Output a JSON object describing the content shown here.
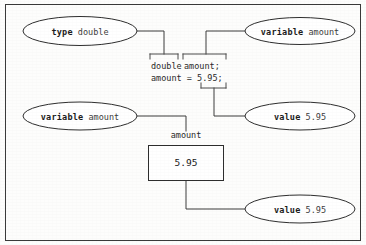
{
  "figure": {
    "frame_color": "#3a3a3a",
    "background_color": "#fdfdfc",
    "line_color": "#3c3c3c"
  },
  "callouts": [
    {
      "id": "type-double",
      "keyword": "type",
      "value": "double"
    },
    {
      "id": "variable-amount-top",
      "keyword": "variable",
      "value": "amount"
    },
    {
      "id": "variable-amount-bottom",
      "keyword": "variable",
      "value": "amount"
    },
    {
      "id": "value-595-middle",
      "keyword": "value",
      "value": "5.95"
    },
    {
      "id": "value-595-bottom",
      "keyword": "value",
      "value": "5.95"
    }
  ],
  "code": {
    "line1_type": "double",
    "line1_variable": "amount;",
    "line2_full": "amount = 5.95;",
    "line2_lhs": "amount = ",
    "line2_value": "5.95",
    "line2_terminator": ";"
  },
  "memory_box": {
    "label": "amount",
    "value": "5.95"
  }
}
